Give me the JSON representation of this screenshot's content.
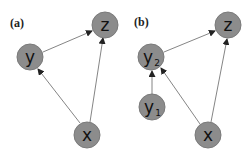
{
  "colors": {
    "node_fill": "#8c8c8c",
    "node_stroke": "#777777",
    "edge": "#555555",
    "background": "#ffffff"
  },
  "panels": [
    {
      "label": "(a)",
      "nodes": [
        {
          "id": "y",
          "label": "y",
          "subscript": ""
        },
        {
          "id": "z",
          "label": "z",
          "subscript": ""
        },
        {
          "id": "x",
          "label": "x",
          "subscript": ""
        }
      ],
      "edges": [
        [
          "y",
          "z"
        ],
        [
          "x",
          "y"
        ],
        [
          "x",
          "z"
        ]
      ]
    },
    {
      "label": "(b)",
      "nodes": [
        {
          "id": "y2",
          "label": "y",
          "subscript": "2"
        },
        {
          "id": "z",
          "label": "z",
          "subscript": ""
        },
        {
          "id": "y1",
          "label": "y",
          "subscript": "1"
        },
        {
          "id": "x",
          "label": "x",
          "subscript": ""
        }
      ],
      "edges": [
        [
          "y2",
          "z"
        ],
        [
          "y1",
          "y2"
        ],
        [
          "x",
          "y2"
        ],
        [
          "x",
          "z"
        ]
      ]
    }
  ]
}
